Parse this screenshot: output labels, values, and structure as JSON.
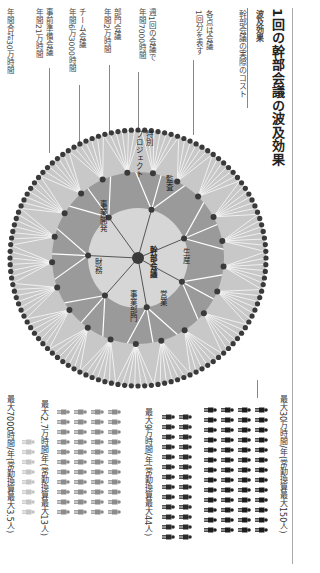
{
  "title": "1回の幹部会議の波及効果",
  "legend": {
    "heading": "波及効果",
    "subheading": "幹部会議の実際のコスト",
    "dot_note_line1": "各点は会議",
    "dot_note_line2": "1回分を表す"
  },
  "levels": [
    {
      "name": "週1回の会議で",
      "hours": "年間7000時間"
    },
    {
      "name": "部門会議",
      "hours": "年間2万時間"
    },
    {
      "name": "チーム会議",
      "hours": "年間6万3000時間"
    },
    {
      "name": "事前準備会議",
      "hours": "年間21万時間"
    },
    {
      "name": "年間合計30万時間",
      "hours": ""
    }
  ],
  "diagram": {
    "center_label": "幹部会議",
    "departments": [
      "生産",
      "営業",
      "事業部門",
      "財務",
      "事業開発",
      "特別プロジェクト",
      "監査"
    ],
    "colors": {
      "outer_ring": "#c8c8c8",
      "middle_ring": "#9a9a9a",
      "inner_disc": "#d6d6d6",
      "dots": "#3a3a3a",
      "spokes": "#ffffff"
    }
  },
  "people_groups": [
    {
      "label": "最大30万時間/年(常勤換算最大150人)",
      "icon_color": "#1e1e1e",
      "count": 150
    },
    {
      "label": "最大9万時間/年(常勤換算最大44人)",
      "icon_color": "#2b2b2b",
      "count": 44
    },
    {
      "label": "最大2.7万時間/年(常勤換算最大13人)",
      "icon_color": "#8c8c8c",
      "count": 13
    },
    {
      "label": "最大7000時間/年(常勤換算最大3.5人)",
      "icon_color": "#c4c4c4",
      "count": 3.5
    }
  ]
}
